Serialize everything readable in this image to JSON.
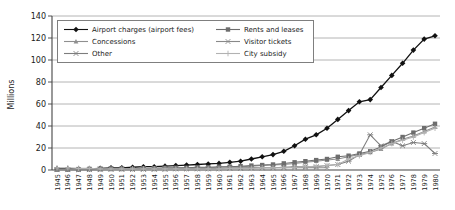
{
  "chart_data": {
    "type": "line",
    "title": "",
    "xlabel": "",
    "ylabel": "Millions",
    "ylim": [
      0,
      140
    ],
    "yticks": [
      0,
      20,
      40,
      60,
      80,
      100,
      120,
      140
    ],
    "grid": true,
    "legend_position": "top-left inside plot, two columns, boxed",
    "x": [
      1945,
      1946,
      1947,
      1948,
      1949,
      1950,
      1951,
      1952,
      1953,
      1954,
      1955,
      1956,
      1957,
      1958,
      1959,
      1960,
      1961,
      1962,
      1963,
      1964,
      1965,
      1966,
      1967,
      1968,
      1969,
      1970,
      1971,
      1972,
      1973,
      1974,
      1975,
      1976,
      1977,
      1978,
      1979,
      1980
    ],
    "series": [
      {
        "name": "Airport charges (airport fees)",
        "marker": "diamond",
        "color": "#111111",
        "values": [
          1,
          1,
          1,
          1,
          1.5,
          2,
          2,
          2.5,
          3,
          3,
          3.5,
          4,
          4.5,
          5,
          5.5,
          6,
          7,
          8,
          10,
          12,
          14,
          17,
          22,
          28,
          32,
          38,
          46,
          54,
          62,
          64,
          75,
          86,
          97,
          109,
          119,
          122
        ]
      },
      {
        "name": "Concessions",
        "marker": "triangle",
        "color": "#8f8f8f",
        "values": [
          0.5,
          0.5,
          0.5,
          0.5,
          0.5,
          1,
          1,
          1,
          1,
          1,
          1.5,
          1.5,
          2,
          2,
          2,
          2.5,
          3,
          3,
          3.5,
          4,
          4.5,
          5,
          6,
          7,
          8,
          9,
          10,
          12,
          14,
          16,
          19,
          24,
          28,
          31,
          35,
          39
        ]
      },
      {
        "name": "Other",
        "marker": "asterisk",
        "color": "#7d7d7d",
        "values": [
          0.3,
          0.3,
          0.3,
          0.3,
          0.3,
          0.5,
          0.5,
          0.5,
          0.5,
          0.5,
          0.5,
          1,
          1,
          1,
          1,
          1,
          1.5,
          1.5,
          2,
          2,
          2,
          2.5,
          3,
          3,
          3,
          4,
          5,
          8,
          14,
          32,
          22,
          26,
          22,
          25,
          24,
          15
        ]
      },
      {
        "name": "Rents and leases",
        "marker": "square",
        "color": "#6d6d6d",
        "values": [
          0.5,
          0.5,
          0.5,
          1,
          1,
          1,
          1,
          1,
          1.5,
          1.5,
          2,
          2,
          2,
          2.5,
          2.5,
          3,
          3,
          3.5,
          4,
          4.5,
          5,
          6,
          7,
          8,
          9,
          10,
          12,
          13,
          15,
          17,
          21,
          26,
          30,
          34,
          38,
          42
        ]
      },
      {
        "name": "Visitor tickets",
        "marker": "x",
        "color": "#898989",
        "values": [
          0.5,
          0.5,
          0.5,
          0.5,
          1,
          1,
          1,
          1,
          1,
          1,
          1,
          1.5,
          1.5,
          1.5,
          1.5,
          1.5,
          2,
          2,
          2,
          2,
          2,
          2,
          2,
          2,
          2,
          2,
          null,
          null,
          null,
          null,
          null,
          null,
          null,
          null,
          null,
          null
        ]
      },
      {
        "name": "City subsidy",
        "marker": "plus",
        "color": "#b2b2b2",
        "values": [
          2,
          2,
          1.5,
          1.5,
          1,
          1,
          1,
          1,
          1,
          1,
          1,
          1,
          1,
          1,
          1,
          1,
          1.5,
          1.5,
          1.5,
          2,
          2,
          2,
          2.5,
          3,
          3.5,
          4,
          5,
          10,
          13,
          16,
          20,
          24,
          27,
          30,
          34,
          38
        ]
      }
    ],
    "legend_columns": [
      [
        "Airport charges (airport fees)",
        "Concessions",
        "Other"
      ],
      [
        "Rents and leases",
        "Visitor tickets",
        "City subsidy"
      ]
    ]
  }
}
